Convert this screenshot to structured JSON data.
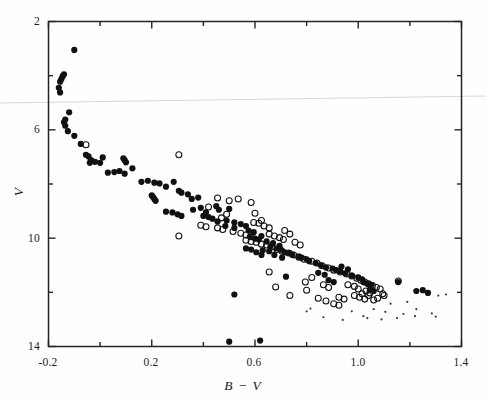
{
  "figure": {
    "background_color": "#fefefe",
    "frame_color": "#222222",
    "point_color": "#111111",
    "artifact_color": "#cfcfcf"
  },
  "chart_data": {
    "type": "scatter",
    "title": "",
    "subtitle": "",
    "xlabel": "B − V",
    "ylabel": "V",
    "xlim": [
      -0.2,
      1.4
    ],
    "ylim": [
      14,
      2
    ],
    "y_inverted": true,
    "grid": false,
    "legend": null,
    "xticks_major": [
      -0.2,
      0.2,
      0.6,
      1.0,
      1.4
    ],
    "xticks_major_labels": [
      "-0.2",
      "0.2",
      "0.6",
      "1.0",
      "1.4"
    ],
    "xticks_minor": [
      0.0,
      0.4,
      0.8,
      1.2
    ],
    "yticks_major": [
      2,
      6,
      10,
      14
    ],
    "yticks_major_labels": [
      "2",
      "6",
      "10",
      "14"
    ],
    "yticks_minor": [
      4,
      8,
      12
    ],
    "annotations": [],
    "series": [
      {
        "name": "filled-circle-members",
        "marker": "filled-circle",
        "marker_size": 3.1,
        "points": [
          [
            -0.1,
            3.05
          ],
          [
            -0.14,
            3.95
          ],
          [
            -0.145,
            4.02
          ],
          [
            -0.15,
            4.12
          ],
          [
            -0.155,
            4.22
          ],
          [
            -0.16,
            4.45
          ],
          [
            -0.155,
            4.62
          ],
          [
            -0.12,
            5.35
          ],
          [
            -0.135,
            5.62
          ],
          [
            -0.14,
            5.72
          ],
          [
            -0.135,
            5.85
          ],
          [
            -0.125,
            6.05
          ],
          [
            -0.1,
            6.22
          ],
          [
            -0.075,
            6.52
          ],
          [
            -0.055,
            6.92
          ],
          [
            -0.045,
            6.98
          ],
          [
            -0.035,
            7.12
          ],
          [
            -0.04,
            7.22
          ],
          [
            -0.02,
            7.18
          ],
          [
            0.0,
            7.22
          ],
          [
            0.01,
            7.02
          ],
          [
            0.03,
            7.58
          ],
          [
            0.055,
            7.56
          ],
          [
            0.075,
            7.52
          ],
          [
            0.095,
            7.62
          ],
          [
            0.09,
            7.05
          ],
          [
            0.095,
            7.12
          ],
          [
            0.1,
            7.2
          ],
          [
            0.125,
            7.42
          ],
          [
            0.16,
            7.92
          ],
          [
            0.185,
            7.88
          ],
          [
            0.21,
            7.95
          ],
          [
            0.23,
            7.98
          ],
          [
            0.255,
            8.1
          ],
          [
            0.2,
            8.42
          ],
          [
            0.205,
            8.48
          ],
          [
            0.21,
            8.55
          ],
          [
            0.215,
            8.62
          ],
          [
            0.285,
            7.92
          ],
          [
            0.305,
            8.25
          ],
          [
            0.315,
            8.32
          ],
          [
            0.34,
            8.38
          ],
          [
            0.355,
            8.55
          ],
          [
            0.38,
            8.5
          ],
          [
            0.36,
            8.95
          ],
          [
            0.39,
            8.88
          ],
          [
            0.41,
            9.05
          ],
          [
            0.45,
            8.82
          ],
          [
            0.46,
            8.95
          ],
          [
            0.5,
            8.92
          ],
          [
            0.49,
            9.35
          ],
          [
            0.52,
            9.42
          ],
          [
            0.4,
            9.18
          ],
          [
            0.42,
            9.22
          ],
          [
            0.435,
            9.28
          ],
          [
            0.455,
            9.38
          ],
          [
            0.255,
            9.02
          ],
          [
            0.28,
            9.05
          ],
          [
            0.3,
            9.12
          ],
          [
            0.315,
            9.18
          ],
          [
            0.485,
            9.55
          ],
          [
            0.52,
            9.62
          ],
          [
            0.545,
            9.48
          ],
          [
            0.565,
            9.55
          ],
          [
            0.575,
            9.72
          ],
          [
            0.595,
            9.78
          ],
          [
            0.58,
            9.95
          ],
          [
            0.6,
            10.02
          ],
          [
            0.615,
            10.05
          ],
          [
            0.625,
            9.92
          ],
          [
            0.645,
            10.12
          ],
          [
            0.67,
            10.18
          ],
          [
            0.66,
            10.3
          ],
          [
            0.685,
            10.38
          ],
          [
            0.7,
            10.42
          ],
          [
            0.695,
            10.28
          ],
          [
            0.715,
            10.52
          ],
          [
            0.735,
            10.55
          ],
          [
            0.745,
            10.62
          ],
          [
            0.77,
            10.68
          ],
          [
            0.78,
            10.72
          ],
          [
            0.8,
            10.78
          ],
          [
            0.63,
            10.45
          ],
          [
            0.655,
            10.48
          ],
          [
            0.81,
            10.85
          ],
          [
            0.835,
            10.92
          ],
          [
            0.855,
            11.0
          ],
          [
            0.875,
            11.08
          ],
          [
            0.9,
            11.12
          ],
          [
            0.915,
            11.18
          ],
          [
            0.675,
            10.62
          ],
          [
            0.705,
            10.72
          ],
          [
            0.93,
            11.22
          ],
          [
            0.95,
            11.3
          ],
          [
            0.975,
            11.38
          ],
          [
            1.0,
            11.45
          ],
          [
            1.015,
            11.52
          ],
          [
            1.02,
            11.62
          ],
          [
            1.035,
            11.68
          ],
          [
            1.05,
            11.72
          ],
          [
            0.565,
            10.38
          ],
          [
            0.585,
            10.42
          ],
          [
            0.605,
            10.52
          ],
          [
            0.625,
            10.62
          ],
          [
            0.935,
            11.05
          ],
          [
            0.96,
            11.15
          ],
          [
            0.845,
            11.28
          ],
          [
            0.87,
            11.35
          ],
          [
            1.155,
            11.62
          ],
          [
            1.25,
            11.92
          ],
          [
            1.27,
            12.02
          ],
          [
            1.225,
            11.95
          ],
          [
            0.72,
            11.42
          ],
          [
            0.52,
            12.08
          ],
          [
            0.5,
            13.82
          ],
          [
            0.62,
            13.78
          ],
          [
            0.885,
            11.55
          ],
          [
            0.905,
            11.62
          ],
          [
            1.045,
            11.9
          ],
          [
            1.06,
            11.95
          ]
        ]
      },
      {
        "name": "open-circle-members",
        "marker": "open-circle",
        "marker_size": 3.0,
        "points": [
          [
            -0.055,
            6.55
          ],
          [
            0.305,
            6.92
          ],
          [
            0.455,
            8.52
          ],
          [
            0.5,
            8.62
          ],
          [
            0.535,
            8.55
          ],
          [
            0.585,
            8.68
          ],
          [
            0.305,
            9.92
          ],
          [
            0.42,
            8.85
          ],
          [
            0.39,
            9.52
          ],
          [
            0.41,
            9.58
          ],
          [
            0.455,
            9.62
          ],
          [
            0.475,
            9.68
          ],
          [
            0.515,
            9.75
          ],
          [
            0.545,
            9.82
          ],
          [
            0.565,
            9.88
          ],
          [
            0.585,
            9.95
          ],
          [
            0.49,
            9.12
          ],
          [
            0.47,
            9.25
          ],
          [
            0.6,
            9.08
          ],
          [
            0.625,
            9.35
          ],
          [
            0.595,
            9.42
          ],
          [
            0.615,
            9.45
          ],
          [
            0.635,
            9.55
          ],
          [
            0.655,
            9.62
          ],
          [
            0.655,
            9.85
          ],
          [
            0.675,
            9.92
          ],
          [
            0.695,
            9.98
          ],
          [
            0.71,
            10.05
          ],
          [
            0.645,
            10.25
          ],
          [
            0.665,
            10.32
          ],
          [
            0.685,
            10.42
          ],
          [
            0.705,
            10.48
          ],
          [
            0.73,
            10.55
          ],
          [
            0.75,
            10.62
          ],
          [
            0.77,
            10.7
          ],
          [
            0.79,
            10.78
          ],
          [
            0.605,
            10.15
          ],
          [
            0.625,
            10.22
          ],
          [
            0.565,
            10.08
          ],
          [
            0.585,
            10.12
          ],
          [
            0.715,
            9.72
          ],
          [
            0.735,
            9.85
          ],
          [
            0.755,
            10.15
          ],
          [
            0.775,
            10.25
          ],
          [
            0.82,
            10.85
          ],
          [
            0.84,
            10.92
          ],
          [
            0.86,
            11.02
          ],
          [
            0.885,
            11.1
          ],
          [
            0.905,
            11.18
          ],
          [
            0.93,
            11.25
          ],
          [
            0.955,
            11.32
          ],
          [
            0.975,
            11.4
          ],
          [
            0.995,
            11.48
          ],
          [
            1.01,
            11.55
          ],
          [
            1.025,
            11.62
          ],
          [
            1.04,
            11.68
          ],
          [
            1.055,
            11.75
          ],
          [
            1.07,
            11.82
          ],
          [
            1.03,
            11.95
          ],
          [
            1.045,
            12.02
          ],
          [
            0.865,
            11.72
          ],
          [
            0.885,
            11.82
          ],
          [
            0.795,
            11.62
          ],
          [
            0.8,
            11.92
          ],
          [
            0.96,
            11.72
          ],
          [
            0.985,
            11.78
          ],
          [
            1.0,
            11.88
          ],
          [
            1.015,
            12.05
          ],
          [
            0.985,
            12.12
          ],
          [
            1.005,
            12.18
          ],
          [
            1.025,
            12.25
          ],
          [
            1.04,
            12.12
          ],
          [
            0.845,
            12.22
          ],
          [
            0.875,
            12.32
          ],
          [
            0.925,
            12.18
          ],
          [
            0.945,
            12.25
          ],
          [
            1.06,
            12.28
          ],
          [
            1.075,
            12.22
          ],
          [
            1.1,
            12.12
          ],
          [
            1.155,
            11.58
          ],
          [
            0.735,
            12.12
          ],
          [
            0.68,
            11.8
          ],
          [
            0.905,
            12.42
          ],
          [
            0.925,
            12.48
          ],
          [
            1.085,
            11.88
          ],
          [
            1.095,
            12.05
          ],
          [
            0.655,
            11.25
          ],
          [
            0.82,
            11.45
          ]
        ]
      },
      {
        "name": "faint-dots",
        "marker": "small-dot",
        "marker_size": 1.1,
        "points": [
          [
            0.865,
            12.92
          ],
          [
            0.94,
            13.02
          ],
          [
            1.02,
            12.88
          ],
          [
            1.035,
            12.95
          ],
          [
            1.09,
            13.0
          ],
          [
            1.105,
            12.72
          ],
          [
            1.15,
            12.95
          ],
          [
            1.175,
            12.8
          ],
          [
            1.22,
            12.88
          ],
          [
            1.285,
            12.78
          ],
          [
            1.3,
            12.9
          ],
          [
            1.31,
            12.12
          ],
          [
            1.34,
            12.08
          ],
          [
            0.975,
            12.7
          ],
          [
            1.06,
            12.62
          ],
          [
            1.125,
            12.42
          ],
          [
            1.19,
            12.35
          ],
          [
            0.8,
            12.7
          ],
          [
            0.815,
            12.6
          ],
          [
            1.225,
            12.62
          ]
        ]
      }
    ]
  },
  "axes": {
    "x_label_text": "B − V",
    "y_label_text": "V",
    "x_tick_texts": [
      "-0.2",
      "0.2",
      "0.6",
      "1.0",
      "1.4"
    ],
    "y_tick_texts": [
      "2",
      "6",
      "10",
      "14"
    ]
  },
  "artifacts": {
    "fold_line_label": "scan-fold-line"
  }
}
